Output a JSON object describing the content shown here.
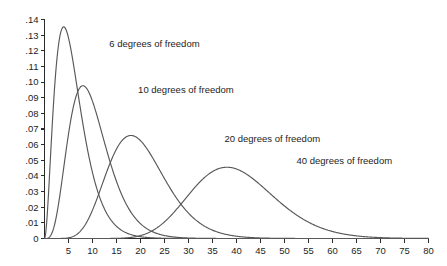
{
  "chart_data": {
    "type": "line",
    "title": "",
    "subtitle": "",
    "xlabel": "",
    "ylabel": "",
    "xlim": [
      0,
      80
    ],
    "ylim": [
      0,
      0.14
    ],
    "grid": false,
    "legend_position": "inline-annotations",
    "x_ticks": [
      0,
      5,
      10,
      15,
      20,
      25,
      30,
      35,
      40,
      45,
      50,
      55,
      60,
      65,
      70,
      75,
      80
    ],
    "x_tick_labels": [
      "",
      "5",
      "10",
      "15",
      "20",
      "25",
      "30",
      "35",
      "40",
      "45",
      "50",
      "55",
      "60",
      "65",
      "70",
      "75",
      "80"
    ],
    "y_ticks": [
      0,
      0.01,
      0.02,
      0.03,
      0.04,
      0.05,
      0.06,
      0.07,
      0.08,
      0.09,
      0.1,
      0.11,
      0.12,
      0.13,
      0.14
    ],
    "y_tick_labels": [
      "0",
      ".01",
      ".02",
      ".03",
      ".04",
      ".05",
      ".06",
      ".07",
      ".08",
      ".09",
      ".10",
      ".11",
      ".12",
      ".13",
      ".14"
    ],
    "curve_color": "#58585a",
    "axis_color": "#2b2b2b",
    "series": [
      {
        "name": "6 degrees of freedom",
        "df": 6,
        "label": "6 degrees of freedom",
        "label_x": 13.5,
        "label_y": 0.1245,
        "peak_x": 4,
        "peak_y": 0.1302
      },
      {
        "name": "10 degrees of freedom",
        "df": 10,
        "label": "10 degrees of freedom",
        "label_x": 19.5,
        "label_y": 0.0955,
        "peak_x": 8,
        "peak_y": 0.1004
      },
      {
        "name": "20 degrees of freedom",
        "df": 20,
        "label": "20 degrees of freedom",
        "label_x": 37.5,
        "label_y": 0.0637,
        "peak_x": 18,
        "peak_y": 0.0657
      },
      {
        "name": "40 degrees of freedom",
        "df": 40,
        "label": "40 degrees of freedom",
        "label_x": 52.5,
        "label_y": 0.0495,
        "peak_x": 38,
        "peak_y": 0.0501
      }
    ]
  }
}
